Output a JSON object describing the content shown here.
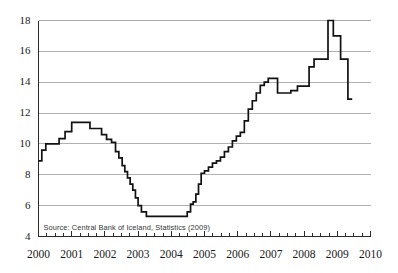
{
  "chart_data": {
    "type": "line",
    "title": "",
    "subtitle": "",
    "xlabel": "",
    "ylabel": "",
    "grid": true,
    "legend": false,
    "legend_position": "none",
    "step_style": "post",
    "xlim": [
      2000.0,
      2010.0
    ],
    "ylim": [
      4,
      18
    ],
    "xticks": [
      "2000",
      "2001",
      "2002",
      "2003",
      "2004",
      "2005",
      "2006",
      "2007",
      "2008",
      "2009",
      "2010"
    ],
    "xtick_values": [
      2000,
      2001,
      2002,
      2003,
      2004,
      2005,
      2006,
      2007,
      2008,
      2009,
      2010
    ],
    "minor_ticks_per_interval": 4,
    "yticks": [
      "4",
      "6",
      "8",
      "10",
      "12",
      "14",
      "16",
      "18"
    ],
    "ytick_values": [
      4,
      6,
      8,
      10,
      12,
      14,
      16,
      18
    ],
    "series": [
      {
        "name": "Central Bank of Iceland policy interest rate",
        "x": [
          2000.0,
          2000.1,
          2000.22,
          2000.4,
          2000.62,
          2000.8,
          2001.0,
          2001.3,
          2001.55,
          2001.72,
          2001.9,
          2002.05,
          2002.2,
          2002.32,
          2002.42,
          2002.52,
          2002.6,
          2002.68,
          2002.76,
          2002.84,
          2002.92,
          2003.0,
          2003.1,
          2003.25,
          2004.35,
          2004.48,
          2004.58,
          2004.66,
          2004.74,
          2004.82,
          2004.9,
          2005.0,
          2005.12,
          2005.24,
          2005.36,
          2005.48,
          2005.6,
          2005.72,
          2005.84,
          2005.96,
          2006.08,
          2006.2,
          2006.32,
          2006.44,
          2006.56,
          2006.68,
          2006.8,
          2006.92,
          2007.05,
          2007.2,
          2007.4,
          2007.6,
          2007.8,
          2008.0,
          2008.15,
          2008.3,
          2008.45,
          2008.58,
          2008.72,
          2008.8,
          2008.88,
          2009.0,
          2009.1,
          2009.2,
          2009.32,
          2009.45
        ],
        "y": [
          8.9,
          9.6,
          10.0,
          10.0,
          10.35,
          10.8,
          11.4,
          11.4,
          11.0,
          11.0,
          10.6,
          10.3,
          10.1,
          9.5,
          9.1,
          8.6,
          8.2,
          7.8,
          7.4,
          7.0,
          6.5,
          6.0,
          5.6,
          5.3,
          5.3,
          5.6,
          6.1,
          6.25,
          6.75,
          7.4,
          8.1,
          8.25,
          8.5,
          8.75,
          8.9,
          9.15,
          9.5,
          9.8,
          10.2,
          10.5,
          10.75,
          11.5,
          12.25,
          12.8,
          13.3,
          13.8,
          14.0,
          14.25,
          14.25,
          13.3,
          13.3,
          13.45,
          13.75,
          13.75,
          15.0,
          15.5,
          15.5,
          15.5,
          18.0,
          18.0,
          17.0,
          17.0,
          15.5,
          15.5,
          12.9,
          12.9
        ]
      }
    ],
    "annotations": [
      {
        "name": "source-note",
        "text": "Source: Central Bank of Iceland, Statistics (2009)",
        "position": "inside-bottom-left"
      }
    ],
    "colors": {
      "line": "#111111",
      "grid": "#a8a8a8",
      "axis": "#2b2b2b",
      "background": "#ffffff",
      "text": "#1a1a1a"
    }
  }
}
